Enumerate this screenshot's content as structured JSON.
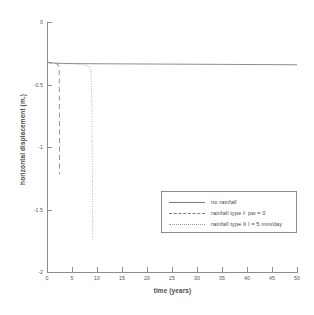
{
  "chart_data": {
    "type": "line",
    "title": "",
    "xlabel": "time (years)",
    "ylabel": "horizontal displacement (m.)",
    "xlim": [
      0,
      50
    ],
    "ylim": [
      -2,
      0
    ],
    "xticks": [
      "0",
      "5",
      "10",
      "15",
      "20",
      "25",
      "30",
      "35",
      "40",
      "45",
      "50"
    ],
    "xtick_values": [
      0,
      5,
      10,
      15,
      20,
      25,
      30,
      35,
      40,
      45,
      50
    ],
    "yticks": [
      "0",
      "-0.5",
      "-1",
      "-1.5",
      "-2"
    ],
    "ytick_values": [
      0,
      -0.5,
      -1,
      -1.5,
      -2
    ],
    "grid": false,
    "legend_position": "lower right",
    "series": [
      {
        "name": "no rainfall",
        "style": "solid",
        "color": "#7a7a7a",
        "x": [
          0,
          0.3,
          0.8,
          1.5,
          3,
          6,
          10,
          20,
          30,
          40,
          50
        ],
        "y": [
          -0.32,
          -0.325,
          -0.327,
          -0.329,
          -0.331,
          -0.333,
          -0.334,
          -0.336,
          -0.338,
          -0.34,
          -0.342
        ]
      },
      {
        "name": "rainfall type I: pw = 0",
        "style": "dashed",
        "color": "#7a7a7a",
        "x": [
          0,
          0.5,
          1.2,
          1.9,
          2.3,
          2.45,
          2.5,
          2.5
        ],
        "y": [
          -0.32,
          -0.325,
          -0.33,
          -0.335,
          -0.345,
          -0.4,
          -0.8,
          -1.22
        ]
      },
      {
        "name": "rainfall type II: I = 5 mm/day",
        "style": "dotted",
        "color": "#9a9a9a",
        "x": [
          0,
          1,
          2.5,
          4,
          6,
          7.5,
          8.4,
          8.8,
          9.0,
          9.1,
          9.15
        ],
        "y": [
          -0.32,
          -0.326,
          -0.331,
          -0.334,
          -0.337,
          -0.342,
          -0.355,
          -0.4,
          -0.7,
          -1.3,
          -1.75
        ]
      }
    ]
  },
  "legend": {
    "items": [
      {
        "label": "no rainfall",
        "style": "solid"
      },
      {
        "label": "rainfall type I:  pw = 0",
        "style": "dashed"
      },
      {
        "label": "rainfall type II  I = 5 mm/day",
        "style": "dotted"
      }
    ]
  }
}
